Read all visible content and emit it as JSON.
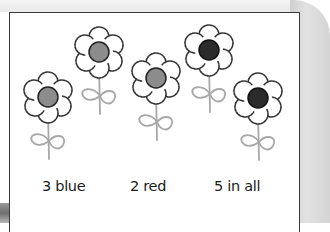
{
  "worksheet": {
    "flowers": [
      {
        "id": 1,
        "center_color": "#8c8c8c",
        "category": "blue"
      },
      {
        "id": 2,
        "center_color": "#8c8c8c",
        "category": "blue"
      },
      {
        "id": 3,
        "center_color": "#8c8c8c",
        "category": "blue"
      },
      {
        "id": 4,
        "center_color": "#2b2b2b",
        "category": "red"
      },
      {
        "id": 5,
        "center_color": "#2b2b2b",
        "category": "red"
      }
    ],
    "labels": {
      "blue_count": "3 blue",
      "red_count": "2 red",
      "total": "5 in all"
    },
    "colors": {
      "blue_center": "#8c8c8c",
      "red_center": "#2b2b2b",
      "petal_outline": "#333333",
      "stem": "#a8a8a8"
    }
  }
}
